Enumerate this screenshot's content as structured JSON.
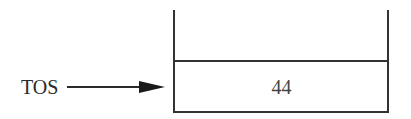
{
  "diagram": {
    "type": "stack",
    "pointer": {
      "label": "TOS",
      "target_index": 0
    },
    "cells": [
      {
        "value": "44"
      }
    ],
    "open_top": true
  },
  "colors": {
    "stroke": "#333333",
    "text": "#2a2a2a",
    "cell_text": "#444444",
    "background": "#ffffff"
  }
}
